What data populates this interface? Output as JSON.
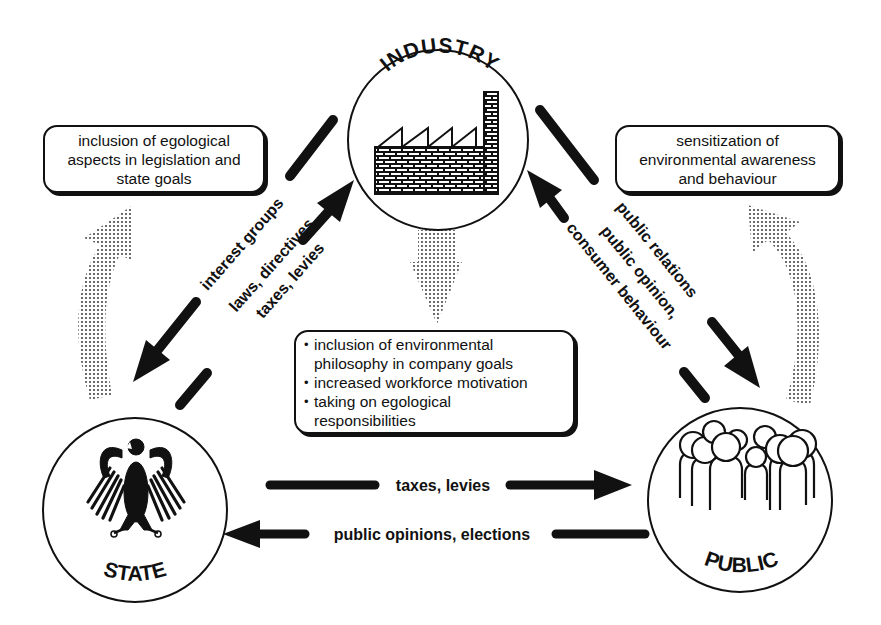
{
  "nodes": {
    "industry": {
      "label": "INDUSTRY",
      "icon": "factory-icon"
    },
    "state": {
      "label": "STATE",
      "icon": "federal-eagle-icon"
    },
    "public": {
      "label": "PUBLIC",
      "icon": "crowd-icon"
    }
  },
  "boxes": {
    "state_goals": {
      "lines": [
        "inclusion of egological",
        "aspects in legislation and",
        "state goals"
      ]
    },
    "public_awareness": {
      "lines": [
        "sensitization of",
        "environmental awareness",
        "and behaviour"
      ]
    },
    "industry_effects": {
      "items": [
        "inclusion of environmental philosophy in company goals",
        "increased workforce motivation",
        "taking on egological responsibilities"
      ],
      "lines": [
        "inclusion of environmental",
        "philosophy in company goals",
        "increased workforce motivation",
        "taking on egological",
        "responsibilities"
      ]
    }
  },
  "arrows": {
    "industry_to_state": {
      "label": "interest groups"
    },
    "state_to_industry": {
      "label_line1": "laws, directives,",
      "label_line2": "taxes, levies"
    },
    "industry_to_public": {
      "label": "public relations"
    },
    "public_to_industry": {
      "label_line1": "public opinion,",
      "label_line2": "consumer behaviour"
    },
    "state_to_public": {
      "label": "taxes, levies"
    },
    "public_to_state": {
      "label": "public opinions, elections"
    }
  },
  "colors": {
    "ink": "#111111",
    "background": "#ffffff",
    "dot_fill": "#555555"
  }
}
